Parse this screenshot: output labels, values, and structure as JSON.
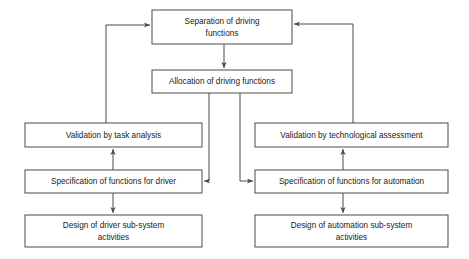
{
  "diagram": {
    "type": "flowchart",
    "background_color": "#ffffff",
    "box_stroke_color": "#4a4a4a",
    "box_fill_color": "#ffffff",
    "text_color": "#1a1a1a",
    "connector_color": "#4a4a4a",
    "nodes": [
      {
        "id": "separation",
        "label_line1": "Separation of driving",
        "label_line2": "functions",
        "x": 152,
        "y": 10,
        "width": 140,
        "height": 34
      },
      {
        "id": "allocation",
        "label_line1": "Allocation of driving functions",
        "label_line2": "",
        "x": 152,
        "y": 70,
        "width": 140,
        "height": 23
      },
      {
        "id": "validation-task",
        "label_line1": "Validation by task analysis",
        "label_line2": "",
        "x": 25,
        "y": 123,
        "width": 177,
        "height": 24
      },
      {
        "id": "validation-tech",
        "label_line1": "Validation by technological assessment",
        "label_line2": "",
        "x": 255,
        "y": 123,
        "width": 193,
        "height": 24
      },
      {
        "id": "spec-driver",
        "label_line1": "Specification of functions for driver",
        "label_line2": "",
        "x": 25,
        "y": 170,
        "width": 177,
        "height": 23
      },
      {
        "id": "spec-automation",
        "label_line1": "Specification of functions for automation",
        "label_line2": "",
        "x": 255,
        "y": 170,
        "width": 193,
        "height": 23
      },
      {
        "id": "design-driver",
        "label_line1": "Design of driver sub-system",
        "label_line2": "activities",
        "x": 25,
        "y": 215,
        "width": 177,
        "height": 32
      },
      {
        "id": "design-automation",
        "label_line1": "Design of automation sub-system",
        "label_line2": "activities",
        "x": 255,
        "y": 215,
        "width": 193,
        "height": 32
      }
    ],
    "connectors": [
      {
        "id": "separation-to-allocation",
        "from": "separation",
        "to": "allocation",
        "style": "straight-down-arrow"
      },
      {
        "id": "allocation-to-spec-driver",
        "from": "allocation",
        "to": "spec-driver",
        "style": "elbow-left-arrow"
      },
      {
        "id": "allocation-to-spec-automation",
        "from": "allocation",
        "to": "spec-automation",
        "style": "elbow-right-arrow"
      },
      {
        "id": "spec-driver-to-validation-task",
        "from": "spec-driver",
        "to": "validation-task",
        "style": "straight-up-arrow"
      },
      {
        "id": "spec-driver-to-design-driver",
        "from": "spec-driver",
        "to": "design-driver",
        "style": "straight-down-arrow"
      },
      {
        "id": "spec-automation-to-validation-tech",
        "from": "spec-automation",
        "to": "validation-tech",
        "style": "straight-up-arrow"
      },
      {
        "id": "spec-automation-to-design-automation",
        "from": "spec-automation",
        "to": "design-automation",
        "style": "straight-down-arrow"
      },
      {
        "id": "validation-task-to-separation",
        "from": "validation-task",
        "to": "separation",
        "style": "feedback-loop-left-arrow"
      },
      {
        "id": "validation-tech-to-separation",
        "from": "validation-tech",
        "to": "separation",
        "style": "feedback-loop-right-arrow"
      }
    ]
  }
}
